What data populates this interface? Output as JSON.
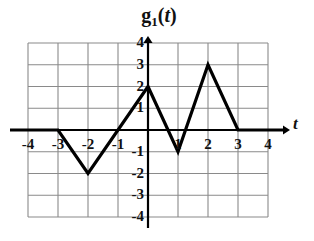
{
  "chart_data": {
    "type": "line",
    "title_base": "g",
    "title_subscript": "1",
    "title_arg_open": "(",
    "title_arg": "t",
    "title_arg_close": ")",
    "xlabel": "t",
    "ylabel": "",
    "xlim": [
      -4.6,
      4.6
    ],
    "ylim": [
      -4,
      4
    ],
    "grid": true,
    "grid_x_lines": [
      -4,
      -3,
      -2,
      -1,
      0,
      1,
      2,
      3,
      4
    ],
    "grid_y_lines": [
      4,
      3,
      2,
      1,
      0,
      -1,
      -2,
      -3,
      -4
    ],
    "legend": null,
    "x_tick_labels": [
      "-4",
      "-3",
      "-2",
      "-1",
      "1",
      "2",
      "3",
      "4"
    ],
    "x_ticks": [
      -4,
      -3,
      -2,
      -1,
      1,
      2,
      3,
      4
    ],
    "y_tick_labels": [
      "4",
      "3",
      "2",
      "1",
      "-1",
      "-2",
      "-3",
      "-4"
    ],
    "y_ticks": [
      4,
      3,
      2,
      1,
      -1,
      -2,
      -3,
      -4
    ],
    "series": [
      {
        "name": "g_1(t)",
        "color": "#000000",
        "points": [
          {
            "x": -4.6,
            "y": 0
          },
          {
            "x": -3,
            "y": 0
          },
          {
            "x": -2,
            "y": -2
          },
          {
            "x": 0,
            "y": 2
          },
          {
            "x": 1,
            "y": -1
          },
          {
            "x": 2,
            "y": 3
          },
          {
            "x": 3,
            "y": 0
          },
          {
            "x": 4.6,
            "y": 0
          }
        ]
      }
    ],
    "vertices": [
      {
        "x": -3,
        "y": 0
      },
      {
        "x": -2,
        "y": -2
      },
      {
        "x": 0,
        "y": 2
      },
      {
        "x": 1,
        "y": -1
      },
      {
        "x": 2,
        "y": 3
      },
      {
        "x": 3,
        "y": 0
      }
    ],
    "axis_color": "#000000",
    "grid_color": "#8a8a8a",
    "curve_color": "#000000"
  }
}
